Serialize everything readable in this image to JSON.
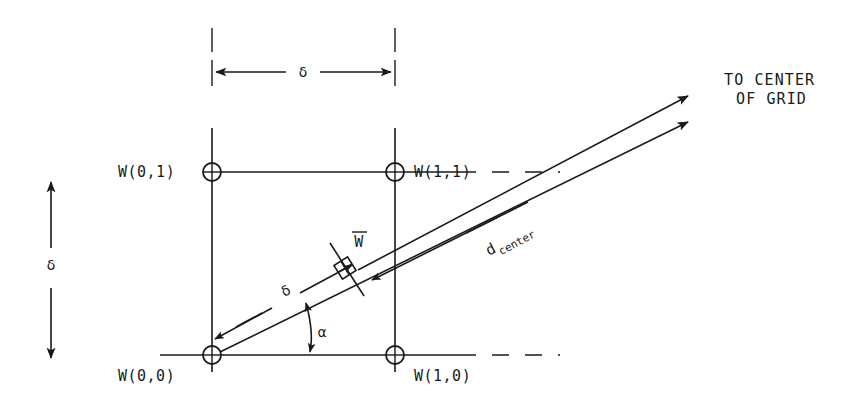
{
  "figure": {
    "nodes": [
      {
        "id": "n00",
        "label": "W(0,0)",
        "x": 212,
        "y": 355,
        "label_x": 118,
        "label_y": 381
      },
      {
        "id": "n01",
        "label": "W(0,1)",
        "x": 212,
        "y": 172,
        "label_x": 118,
        "label_y": 177
      },
      {
        "id": "n10",
        "label": "W(1,0)",
        "x": 395,
        "y": 355,
        "label_x": 414,
        "label_y": 381
      },
      {
        "id": "n11",
        "label": "W(1,1)",
        "x": 395,
        "y": 172,
        "label_x": 414,
        "label_y": 177
      }
    ],
    "dimension_horizontal": {
      "label": "δ",
      "label_x": 303,
      "label_y": 77,
      "x1": 212,
      "x2": 395,
      "y": 72
    },
    "dimension_vertical": {
      "label": "δ",
      "label_x": 51,
      "label_y": 270,
      "x": 51,
      "y1": 180,
      "y2": 360
    },
    "diagonal_distance": {
      "label": "δ",
      "label_x": 288,
      "label_y": 295
    },
    "angle": {
      "label": "α",
      "label_x": 322,
      "label_y": 337
    },
    "center_distance": {
      "label_main": "d",
      "label_sub": "center",
      "label_x": 489,
      "label_y": 256
    },
    "interp_point": {
      "label_main": "W",
      "label_overbar": true,
      "label_x": 358,
      "label_y": 245,
      "x": 345,
      "y": 268
    },
    "destination": {
      "line1": "TO CENTER",
      "line2": "OF GRID",
      "x": 724,
      "y1": 85,
      "y2": 104
    },
    "colors": {
      "ink": "#1a1a1a",
      "background": "#ffffff"
    }
  }
}
